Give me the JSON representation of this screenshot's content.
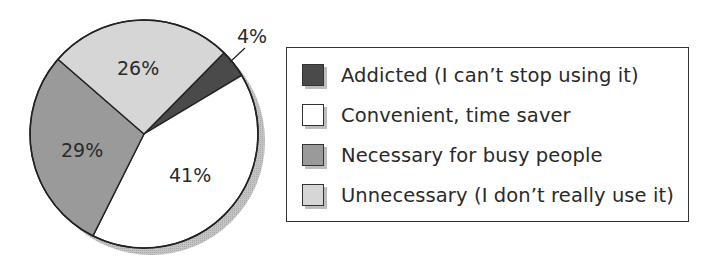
{
  "chart_data": {
    "type": "pie",
    "title": "",
    "slices": [
      {
        "label": "Addicted (I can’t stop using it)",
        "value": 4,
        "display": "4%",
        "color": "#4a4a4a"
      },
      {
        "label": "Convenient, time saver",
        "value": 41,
        "display": "41%",
        "color": "#ffffff"
      },
      {
        "label": "Necessary for busy people",
        "value": 29,
        "display": "29%",
        "color": "#9a9a9a"
      },
      {
        "label": "Unnecessary (I don’t really use it)",
        "value": 26,
        "display": "26%",
        "color": "#d6d6d6"
      }
    ],
    "legend_position": "right",
    "shadow": true
  },
  "legend": {
    "items": [
      {
        "label": "Addicted (I can’t stop using it)",
        "color": "#4a4a4a"
      },
      {
        "label": "Convenient, time saver",
        "color": "#ffffff"
      },
      {
        "label": "Necessary for busy people",
        "color": "#9a9a9a"
      },
      {
        "label": "Unnecessary (I don’t really use it)",
        "color": "#d6d6d6"
      }
    ]
  }
}
